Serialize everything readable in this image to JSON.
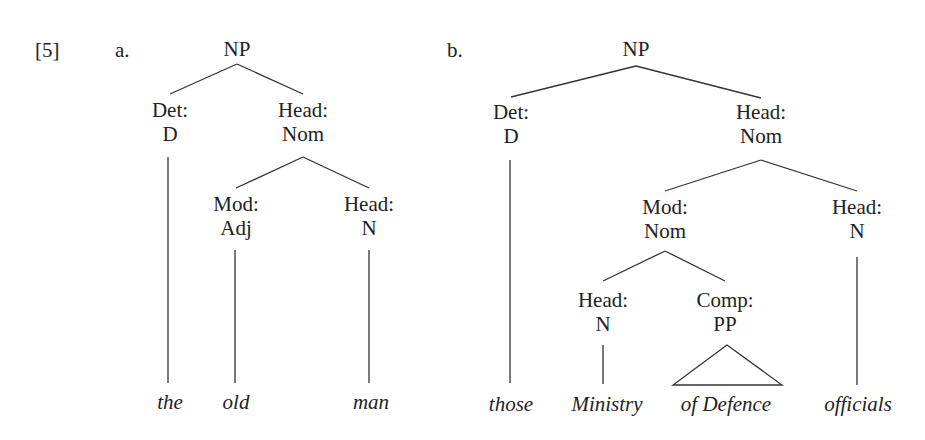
{
  "example_number": "[5]",
  "trees": [
    {
      "label": "a.",
      "nodes": {
        "root": "NP",
        "det_fn": "Det:",
        "det_cat": "D",
        "head_fn": "Head:",
        "head_cat": "Nom",
        "mod_fn": "Mod:",
        "mod_cat": "Adj",
        "head2_fn": "Head:",
        "head2_cat": "N"
      },
      "words": [
        "the",
        "old",
        "man"
      ]
    },
    {
      "label": "b.",
      "nodes": {
        "root": "NP",
        "det_fn": "Det:",
        "det_cat": "D",
        "head_fn": "Head:",
        "head_cat": "Nom",
        "mod_fn": "Mod:",
        "mod_cat": "Nom",
        "head2_fn": "Head:",
        "head2_cat": "N",
        "inner_head_fn": "Head:",
        "inner_head_cat": "N",
        "comp_fn": "Comp:",
        "comp_cat": "PP"
      },
      "words": [
        "those",
        "Ministry",
        "of Defence",
        "officials"
      ]
    }
  ]
}
